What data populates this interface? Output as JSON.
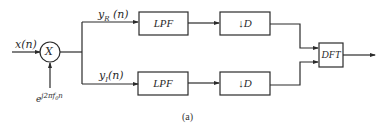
{
  "diagram": {
    "type": "block-diagram",
    "input": {
      "label": "x(n)"
    },
    "mixer": {
      "symbol": "X",
      "carrier_label_base": "e",
      "carrier_label_exp": "j2πf",
      "carrier_label_sub": "0",
      "carrier_label_tail": "n"
    },
    "branches": [
      {
        "signal_base": "y",
        "signal_sub": "R",
        "signal_tail": " (n)",
        "filter": "LPF",
        "decimator": "↓D"
      },
      {
        "signal_base": "y",
        "signal_sub": "I",
        "signal_tail": "(n)",
        "filter": "LPF",
        "decimator": "↓D"
      }
    ],
    "transform": {
      "label": "DFT"
    },
    "caption": "(a)"
  },
  "colors": {
    "line": "#2b2b2b",
    "background": "#ffffff"
  }
}
